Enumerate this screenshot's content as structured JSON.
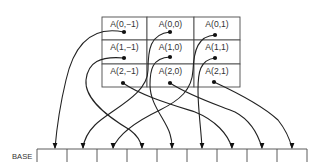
{
  "diagram": {
    "array_label_format": "A(i,j)",
    "grid": {
      "x": 102,
      "y": 17,
      "col_edges": [
        102,
        147,
        194,
        240
      ],
      "row_edges": [
        17,
        40,
        64,
        87
      ],
      "cells": [
        {
          "row": 0,
          "col": 0,
          "label": "A(0,−1)",
          "dot": [
            124,
            32
          ]
        },
        {
          "row": 0,
          "col": 1,
          "label": "A(0,0)",
          "dot": [
            170,
            32
          ]
        },
        {
          "row": 0,
          "col": 2,
          "label": "A(0,1)",
          "dot": [
            215,
            35
          ]
        },
        {
          "row": 1,
          "col": 0,
          "label": "A(1,−1)",
          "dot": [
            124,
            58
          ]
        },
        {
          "row": 1,
          "col": 1,
          "label": "A(1,0)",
          "dot": [
            170,
            57
          ]
        },
        {
          "row": 1,
          "col": 2,
          "label": "A(1,1)",
          "dot": [
            215,
            58
          ]
        },
        {
          "row": 2,
          "col": 0,
          "label": "A(2,−1)",
          "dot": [
            123,
            83
          ]
        },
        {
          "row": 2,
          "col": 1,
          "label": "A(2,0)",
          "dot": [
            170,
            83
          ]
        },
        {
          "row": 2,
          "col": 2,
          "label": "A(2,1)",
          "dot": [
            214,
            82
          ]
        }
      ]
    },
    "base": {
      "label": "BASE",
      "label_pos": [
        12,
        159
      ],
      "top_y": 149,
      "dividers": [
        37,
        67,
        97,
        127,
        157,
        187,
        217,
        247,
        277,
        307
      ],
      "cell_count": 9
    },
    "arrows": [
      {
        "from": "A(0,−1)",
        "to_cell": 1,
        "d": "M124,32 C95,26 75,40 66,80 C60,105 57,125 55,148",
        "head": [
          55,
          149
        ]
      },
      {
        "from": "A(0,0)",
        "to_cell": 2,
        "d": "M170,32 C150,34 148,50 148,70 C148,95 110,110 95,125 C88,132 84,140 83,148",
        "head": [
          83,
          149
        ]
      },
      {
        "from": "A(0,1)",
        "to_cell": 3,
        "d": "M215,35 C198,36 194,50 193,70 C192,90 180,100 160,110 C135,122 118,135 113,148",
        "head": [
          113,
          149
        ]
      },
      {
        "from": "A(1,−1)",
        "to_cell": 4,
        "d": "M124,58 C100,56 88,62 86,80 C84,100 110,118 130,130 C138,136 141,142 142,148",
        "head": [
          142,
          149
        ]
      },
      {
        "from": "A(1,0)",
        "to_cell": 5,
        "d": "M170,57 C152,58 150,70 150,85 C150,105 166,120 170,134 C172,140 172,144 172,148",
        "head": [
          172,
          149
        ]
      },
      {
        "from": "A(1,1)",
        "to_cell": 6,
        "d": "M215,58 C200,60 198,72 198,90 C198,110 201,128 202,148",
        "head": [
          202,
          149
        ]
      },
      {
        "from": "A(2,−1)",
        "to_cell": 7,
        "d": "M123,83 C140,95 170,104 195,112 C215,120 228,134 232,148",
        "head": [
          232,
          149
        ]
      },
      {
        "from": "A(2,0)",
        "to_cell": 8,
        "d": "M170,83 C190,96 215,104 235,112 C250,120 258,134 262,148",
        "head": [
          262,
          149
        ]
      },
      {
        "from": "A(2,1)",
        "to_cell": 9,
        "d": "M214,82 C240,94 265,108 278,120 C286,130 290,140 292,148",
        "head": [
          292,
          149
        ]
      }
    ],
    "colors": {
      "line": "#222222",
      "grid": "#4a4a4a",
      "text": "#333333",
      "background": "#ffffff"
    }
  }
}
